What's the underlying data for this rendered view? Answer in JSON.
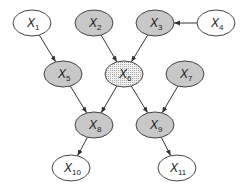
{
  "diagram": {
    "type": "directed-graph",
    "colors": {
      "observed": "#c8c8c8",
      "latent": "#ffffff",
      "query": "#ececec",
      "stroke": "#444444"
    },
    "nodes": [
      {
        "id": "X1",
        "base": "X",
        "sub": "1",
        "cx": 32,
        "cy": 23,
        "fill": "latent"
      },
      {
        "id": "X2",
        "base": "X",
        "sub": "2",
        "cx": 94,
        "cy": 23,
        "fill": "observed"
      },
      {
        "id": "X3",
        "base": "X",
        "sub": "3",
        "cx": 155,
        "cy": 23,
        "fill": "observed"
      },
      {
        "id": "X4",
        "base": "X",
        "sub": "4",
        "cx": 216,
        "cy": 23,
        "fill": "latent"
      },
      {
        "id": "X5",
        "base": "X",
        "sub": "5",
        "cx": 63,
        "cy": 74,
        "fill": "observed"
      },
      {
        "id": "X6",
        "base": "X",
        "sub": "6",
        "cx": 124,
        "cy": 74,
        "fill": "query"
      },
      {
        "id": "X7",
        "base": "X",
        "sub": "7",
        "cx": 185,
        "cy": 74,
        "fill": "observed"
      },
      {
        "id": "X8",
        "base": "X",
        "sub": "8",
        "cx": 94,
        "cy": 125,
        "fill": "observed"
      },
      {
        "id": "X9",
        "base": "X",
        "sub": "9",
        "cx": 155,
        "cy": 125,
        "fill": "observed"
      },
      {
        "id": "X10",
        "base": "X",
        "sub": "10",
        "cx": 71,
        "cy": 168,
        "fill": "latent"
      },
      {
        "id": "X11",
        "base": "X",
        "sub": "11",
        "cx": 177,
        "cy": 168,
        "fill": "latent"
      }
    ],
    "edges": [
      {
        "from": "X1",
        "to": "X5"
      },
      {
        "from": "X2",
        "to": "X6"
      },
      {
        "from": "X3",
        "to": "X6"
      },
      {
        "from": "X4",
        "to": "X3"
      },
      {
        "from": "X5",
        "to": "X8"
      },
      {
        "from": "X6",
        "to": "X8"
      },
      {
        "from": "X6",
        "to": "X9"
      },
      {
        "from": "X7",
        "to": "X9"
      },
      {
        "from": "X8",
        "to": "X10"
      },
      {
        "from": "X9",
        "to": "X11"
      }
    ]
  }
}
